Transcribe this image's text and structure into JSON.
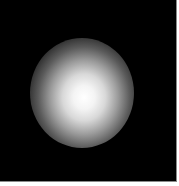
{
  "image": {
    "description": "Grayscale photograph: diffuse bright white blurred spot on black background",
    "background_color": "#000000",
    "spot_color": "#ffffff",
    "border_color": "#8a8a8a"
  }
}
